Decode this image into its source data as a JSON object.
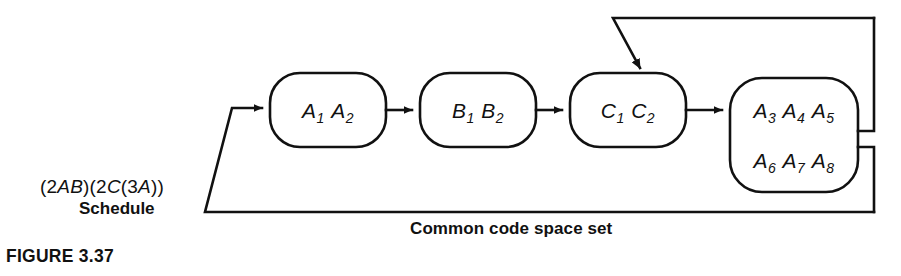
{
  "figure": {
    "caption": "FIGURE 3.37",
    "schedule_expression": "(2AB)(2C(3A))",
    "schedule_word": "Schedule",
    "common_label": "Common code space set",
    "background_color": "#ffffff",
    "line_color": "#111111"
  },
  "nodes": [
    {
      "id": "node-a1a2",
      "name": "stage-a1-a2",
      "tokens": [
        {
          "letter": "A",
          "sub": "1"
        },
        {
          "letter": "A",
          "sub": "2"
        }
      ],
      "text": "A1 A2",
      "x": 270,
      "y": 73,
      "width": 116,
      "height": 74
    },
    {
      "id": "node-b1b2",
      "name": "stage-b1-b2",
      "tokens": [
        {
          "letter": "B",
          "sub": "1"
        },
        {
          "letter": "B",
          "sub": "2"
        }
      ],
      "text": "B1 B2",
      "x": 420,
      "y": 73,
      "width": 116,
      "height": 74
    },
    {
      "id": "node-c1c2",
      "name": "stage-c1-c2",
      "tokens": [
        {
          "letter": "C",
          "sub": "1"
        },
        {
          "letter": "C",
          "sub": "2"
        }
      ],
      "text": "C1 C2",
      "x": 570,
      "y": 73,
      "width": 116,
      "height": 74
    },
    {
      "id": "node-a3a8",
      "name": "stage-a3-a8",
      "rows": [
        {
          "text": "A3 A4 A5",
          "tokens": [
            {
              "letter": "A",
              "sub": "3"
            },
            {
              "letter": "A",
              "sub": "4"
            },
            {
              "letter": "A",
              "sub": "5"
            }
          ]
        },
        {
          "text": "A6 A7 A8",
          "tokens": [
            {
              "letter": "A",
              "sub": "6"
            },
            {
              "letter": "A",
              "sub": "7"
            },
            {
              "letter": "A",
              "sub": "8"
            }
          ]
        }
      ],
      "x": 730,
      "y": 78,
      "width": 128,
      "height": 114
    }
  ],
  "connectors": [
    {
      "name": "arrow-into-a1a2",
      "from": "feedback-bottom",
      "to": "node-a1a2"
    },
    {
      "name": "arrow-a1a2-to-b1b2",
      "from": "node-a1a2",
      "to": "node-b1b2"
    },
    {
      "name": "arrow-b1b2-to-c1c2",
      "from": "node-b1b2",
      "to": "node-c1c2"
    },
    {
      "name": "arrow-c1c2-to-a3a8",
      "from": "node-c1c2",
      "to": "node-a3a8"
    },
    {
      "name": "feedback-top-into-c1c2",
      "from": "node-a3a8",
      "to": "node-c1c2"
    },
    {
      "name": "feedback-bottom-into-a1a2",
      "from": "node-a3a8",
      "to": "node-a1a2"
    }
  ]
}
